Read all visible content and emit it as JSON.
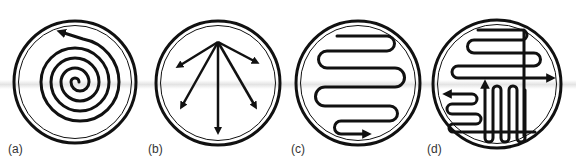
{
  "figure": {
    "panels": [
      {
        "id": "a",
        "label": "(a)",
        "pattern": "spiral streak",
        "label_x": 8,
        "label_y": 142
      },
      {
        "id": "b",
        "label": "(b)",
        "pattern": "radial fan streak",
        "label_x": 148,
        "label_y": 142
      },
      {
        "id": "c",
        "label": "(c)",
        "pattern": "serpentine zig-zag streak",
        "label_x": 291,
        "label_y": 142
      },
      {
        "id": "d",
        "label": "(d)",
        "pattern": "quadrant streak (multi-direction)",
        "label_x": 427,
        "label_y": 142
      }
    ],
    "colors": {
      "ink": "#111111",
      "background": "#ffffff",
      "scan_band": "#cdcdcd"
    }
  }
}
